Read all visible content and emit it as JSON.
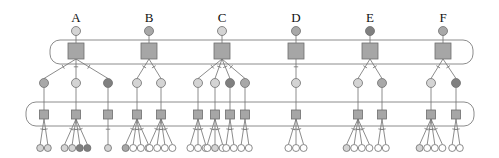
{
  "colors": {
    "white": "#ffffff",
    "light": "#d4d4d4",
    "medium": "#a8a8a8",
    "dark": "#808080",
    "square": "#a6a6a6",
    "stroke": "#6e6e6e",
    "band": "#8c8c8c"
  },
  "layout": {
    "top_band": {
      "x": 50,
      "y": 40,
      "w": 423,
      "h": 24,
      "r": 10
    },
    "bottom_band": {
      "x": 26,
      "y": 102,
      "w": 448,
      "h": 24,
      "r": 10
    },
    "label_y": 22,
    "root_y": 31,
    "big_square_y": 43,
    "big_square_size": 16,
    "mid_y": 83,
    "small_square_y": 110,
    "small_square_size": 9,
    "leaf_y": 148
  },
  "trees": [
    {
      "label": "A",
      "x": 76,
      "root": "light",
      "children": [
        {
          "x": 44,
          "color": "medium",
          "leaves": [
            "light",
            "light"
          ]
        },
        {
          "x": 76,
          "color": "light",
          "leaves": [
            "light",
            "light",
            "dark",
            "dark"
          ]
        },
        {
          "x": 108,
          "color": "dark",
          "leaves": [
            "light"
          ]
        }
      ]
    },
    {
      "label": "B",
      "x": 149,
      "root": "medium",
      "children": [
        {
          "x": 137,
          "color": "light",
          "leaves": [
            "medium",
            "white",
            "white",
            "white"
          ]
        },
        {
          "x": 161,
          "color": "light",
          "leaves": [
            "white",
            "white",
            "white",
            "white"
          ]
        }
      ]
    },
    {
      "label": "C",
      "x": 222,
      "root": "light",
      "children": [
        {
          "x": 198,
          "color": "light",
          "leaves": [
            "white",
            "white",
            "white"
          ]
        },
        {
          "x": 215,
          "color": "light",
          "leaves": [
            "white",
            "light",
            "white"
          ]
        },
        {
          "x": 230,
          "color": "dark",
          "leaves": [
            "white",
            "white"
          ]
        },
        {
          "x": 245,
          "color": "medium",
          "leaves": [
            "white",
            "white"
          ]
        }
      ]
    },
    {
      "label": "D",
      "x": 296,
      "root": "medium",
      "children": [
        {
          "x": 296,
          "color": "light",
          "leaves": [
            "white",
            "white",
            "white"
          ]
        }
      ]
    },
    {
      "label": "E",
      "x": 370,
      "root": "dark",
      "children": [
        {
          "x": 358,
          "color": "light",
          "leaves": [
            "light",
            "white",
            "white",
            "white"
          ]
        },
        {
          "x": 382,
          "color": "medium",
          "leaves": [
            "white",
            "white"
          ]
        }
      ]
    },
    {
      "label": "F",
      "x": 443,
      "root": "medium",
      "children": [
        {
          "x": 431,
          "color": "light",
          "leaves": [
            "light",
            "white",
            "white",
            "white"
          ]
        },
        {
          "x": 456,
          "color": "dark",
          "leaves": [
            "white",
            "white"
          ]
        }
      ]
    }
  ]
}
